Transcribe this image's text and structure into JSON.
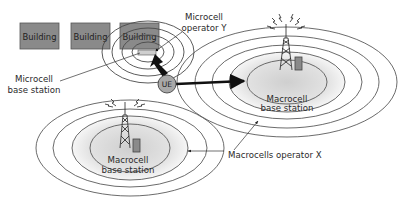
{
  "diagram": {
    "buildings": [
      {
        "label": "Building"
      },
      {
        "label": "Building"
      },
      {
        "label": "Building"
      }
    ],
    "ue": {
      "label": "UE"
    },
    "labels": {
      "microcell_operator_line1": "Microcell",
      "microcell_operator_line2": "operator Y",
      "microcell_bs_line1": "Microcell",
      "microcell_bs_line2": "base station",
      "macro_right_line1": "Macrocell",
      "macro_right_line2": "base station",
      "macro_left_line1": "Macrocell",
      "macro_left_line2": "base station",
      "macrocells_operator": "Macrocells operator X"
    },
    "colors": {
      "building_fill": "#8a8a8a",
      "building_stroke": "#555555",
      "ring_stroke": "#555555",
      "core_fill": "#d8d8d8",
      "ue_fill": "#a8a8a8",
      "arrow": "#111111"
    }
  }
}
